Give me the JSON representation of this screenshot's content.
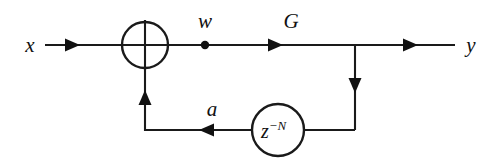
{
  "diagram": {
    "type": "signal-flow-block-diagram",
    "colors": {
      "line": "#1a1a1a",
      "background": "#ffffff",
      "text": "#111111"
    },
    "labels": {
      "input": "x",
      "sum_output": "w",
      "gain": "G",
      "output": "y",
      "feedback": "a",
      "delay_base": "z",
      "delay_exponent": "−N"
    },
    "nodes": [
      {
        "id": "summing-junction",
        "kind": "adder",
        "glyph": "⊕",
        "cx": 145,
        "cy": 45,
        "r": 23
      },
      {
        "id": "delay-block",
        "kind": "circle-block",
        "label": "z^-N",
        "cx": 278,
        "cy": 130,
        "r": 26
      },
      {
        "id": "tap-node-w",
        "kind": "dot",
        "cx": 205,
        "cy": 45,
        "r": 4
      }
    ],
    "signals": [
      {
        "name": "x",
        "role": "input",
        "x": 30,
        "y": 52
      },
      {
        "name": "w",
        "role": "summer-output",
        "x": 196,
        "y": 25
      },
      {
        "name": "G",
        "role": "gain",
        "x": 282,
        "y": 25
      },
      {
        "name": "y",
        "role": "output",
        "x": 468,
        "y": 52
      },
      {
        "name": "a",
        "role": "feedback",
        "x": 203,
        "y": 113
      }
    ]
  }
}
